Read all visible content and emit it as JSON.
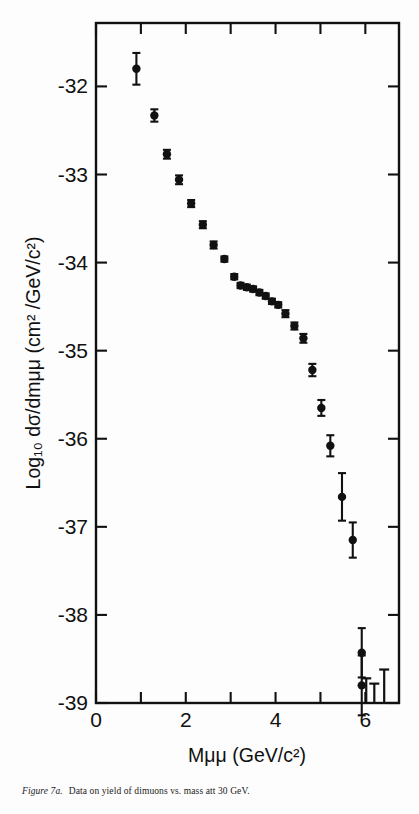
{
  "figure": {
    "caption_label": "Figure 7a.",
    "caption_text": "Data on yield of dimuons vs. mass att 30 GeV.",
    "background_color": "#fdfdfd",
    "ink_color": "#111111"
  },
  "chart_data": {
    "type": "scatter",
    "title": "",
    "xlabel": "Mμμ  (GeV/c²)",
    "ylabel": "Log₁₀ dσ/dmμμ (cm² /GeV/c²)",
    "xlim": [
      0,
      6.75
    ],
    "ylim": [
      -39,
      -31.28
    ],
    "grid": false,
    "legend": "none",
    "xticks": [
      0,
      1,
      2,
      3,
      4,
      5,
      6
    ],
    "xticklabels": [
      "0",
      "",
      "2",
      "",
      "4",
      "",
      "6"
    ],
    "yticks": [
      -32,
      -33,
      -34,
      -35,
      -36,
      -37,
      -38,
      -39
    ],
    "yticklabels": [
      "-32",
      "-33",
      "-34",
      "-35",
      "-36",
      "-37",
      "-38",
      "-39"
    ],
    "marker": "filled-circle",
    "marker_color": "#111111",
    "errorbar_color": "#111111",
    "x": [
      0.9,
      1.3,
      1.58,
      1.85,
      2.12,
      2.38,
      2.62,
      2.86,
      3.08,
      3.22,
      3.36,
      3.5,
      3.64,
      3.78,
      3.92,
      4.06,
      4.22,
      4.42,
      4.62,
      4.82,
      5.02,
      5.22,
      5.48,
      5.72,
      5.92
    ],
    "y": [
      -31.8,
      -32.33,
      -32.77,
      -33.06,
      -33.33,
      -33.57,
      -33.8,
      -33.96,
      -34.16,
      -34.26,
      -34.28,
      -34.3,
      -34.34,
      -34.38,
      -34.44,
      -34.48,
      -34.58,
      -34.72,
      -34.86,
      -35.22,
      -35.65,
      -36.08,
      -36.66,
      -37.15,
      -38.43
    ],
    "yerr": [
      0.18,
      0.07,
      0.05,
      0.05,
      0.04,
      0.04,
      0.04,
      0.03,
      0.03,
      0.03,
      0.03,
      0.03,
      0.03,
      0.03,
      0.03,
      0.03,
      0.04,
      0.04,
      0.05,
      0.07,
      0.09,
      0.12,
      0.27,
      0.2,
      0.28
    ],
    "second_point": {
      "x": 5.92,
      "y": -38.8,
      "yerr": 0.34
    },
    "upper_limits": [
      {
        "x": 6.02,
        "y_top": -38.72
      },
      {
        "x": 6.2,
        "y_top": -38.78
      },
      {
        "x": 6.42,
        "y_top": -38.62
      }
    ]
  },
  "axis_labels": {
    "y_axis_text": "Log₁₀ dσ/dmμμ (cm² /GeV/c²)",
    "x_axis_text": "Mμμ  (GeV/c²)"
  }
}
